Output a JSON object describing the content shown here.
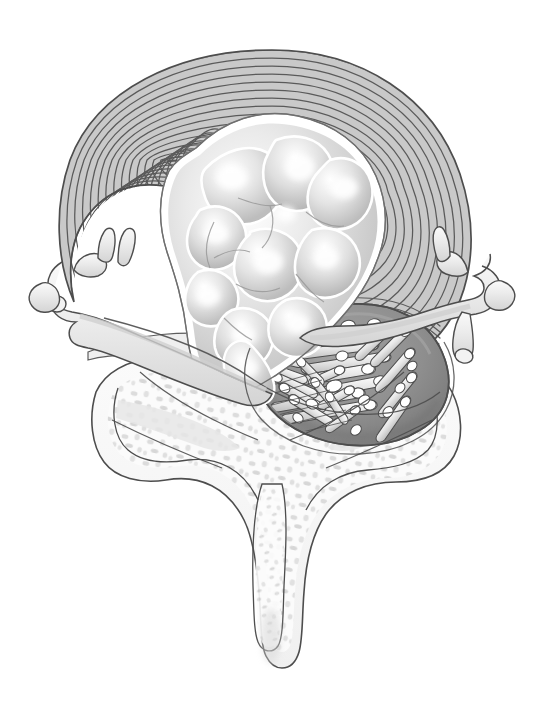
{
  "figure": {
    "title": "Axial cross-section of lumbar vertebra with posterolateral intervertebral disc herniation",
    "view": "axial / transverse section",
    "style": "grayscale medical line illustration with airbrush shading",
    "background_color": "#ffffff",
    "outline_color": "#4a4a4a",
    "canvas": {
      "width": 544,
      "height": 701
    }
  },
  "palette": {
    "background": "#ffffff",
    "ink": "#4d4d4d",
    "ink_soft": "#6e6e6e",
    "annulus_band": "#c9c9c9",
    "annulus_line": "#5a5a5a",
    "nucleus_light": "#ffffff",
    "nucleus_mid": "#d8d8d8",
    "nucleus_shadow": "#b0b0b0",
    "thecal_sac": "#8e8e8e",
    "thecal_sac_edge": "#7a7a7a",
    "nerve_root_fill": "#e8e8e8",
    "nerve_root_tip": "#ffffff",
    "bone_cortical": "#f4f4f4",
    "bone_trabecular": "#dcdcdc",
    "nerve_pale": "#ededed",
    "ligament": "#e2e2e2"
  },
  "structures": [
    {
      "id": "annulus-fibrosus",
      "label": "Annulus fibrosus",
      "description": "Concentric lamellar rings forming the outer ring of the intervertebral disc; occupies the anterior two-thirds of the section and is swept posteriorly on the right where it is disrupted.",
      "ring_count": 15,
      "fill": "#c9c9c9",
      "stroke": "#5a5a5a"
    },
    {
      "id": "nucleus-pulposus",
      "label": "Nucleus pulposus",
      "description": "Central gelatinous lobulated core with bright highlights and soft shadow, displaced posteriorly and to the right.",
      "fill": "#dcdcdc",
      "highlight": "#ffffff"
    },
    {
      "id": "herniation",
      "label": "Herniated disc fragment / extrusion",
      "description": "Posterolateral extrusion of nuclear material through torn annular lamellae into the right side of the spinal canal.",
      "side": "right posterolateral"
    },
    {
      "id": "thecal-sac",
      "label": "Thecal sac (dural sac)",
      "description": "Dark gray compressed ovoid sac in the right posterior canal, deformed by the herniation.",
      "fill": "#8e8e8e"
    },
    {
      "id": "cauda-equina",
      "label": "Cauda equina nerve roots",
      "description": "Bundle of cylindrical nerve rootlets with pale rounded cut ends, crowded within the thecal sac.",
      "count": 30,
      "fill": "#e8e8e8",
      "tip": "#ffffff"
    },
    {
      "id": "nerve-root-left",
      "label": "Left exiting nerve root",
      "description": "Pale branching nerve root passing laterally out of the left neural foramen with a dorsal root ganglion bulge."
    },
    {
      "id": "nerve-root-right",
      "label": "Right exiting nerve root",
      "description": "Pale branching nerve root passing laterally out of the right neural foramen, displaced by the herniation."
    },
    {
      "id": "vertebral-body",
      "label": "Vertebral body / endplate",
      "description": "Cortical rim with speckled cancellous trabecular bone beneath the disc."
    },
    {
      "id": "pedicle-lamina-left",
      "label": "Left pedicle and lamina",
      "description": "Bony arch with trabecular speckle forming the left posterior canal wall."
    },
    {
      "id": "pedicle-lamina-right",
      "label": "Right pedicle and lamina",
      "description": "Bony arch with trabecular speckle forming the right posterior canal wall."
    },
    {
      "id": "spinous-process",
      "label": "Spinous process",
      "description": "Midline posterior bony projection extending inferiorly with a bulbous tip."
    },
    {
      "id": "transverse-process-left",
      "label": "Left transverse process",
      "description": "Lateral bony projection on the left."
    },
    {
      "id": "transverse-process-right",
      "label": "Right transverse process",
      "description": "Lateral bony projection on the right."
    },
    {
      "id": "posterior-longitudinal-ligament",
      "label": "Posterior longitudinal ligament",
      "description": "Thin pale band crossing the posterior disc margin."
    }
  ],
  "annotations": {
    "labels_visible": false,
    "callouts": [],
    "caption": ""
  }
}
